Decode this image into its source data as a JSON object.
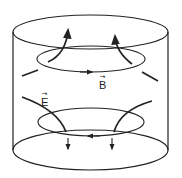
{
  "diagram": {
    "type": "physics-field-lines",
    "labels": {
      "magnetic_field": "B",
      "electric_field": "E",
      "vector_arrow": "→"
    },
    "colors": {
      "stroke": "#222222",
      "background": "#ffffff"
    },
    "elements": {
      "cylinder": "cylinder-outline",
      "upper_loop": {
        "name": "magnetic-field-loop",
        "label": "B",
        "arrow_direction": "right"
      },
      "lower_loop": {
        "name": "electric-field-loop",
        "arrow_direction": "left"
      },
      "upper_curves": {
        "count": 2,
        "arrow_direction": "up"
      },
      "lower_curves": {
        "count": 2,
        "arrow_direction": "down",
        "label": "E"
      }
    }
  }
}
